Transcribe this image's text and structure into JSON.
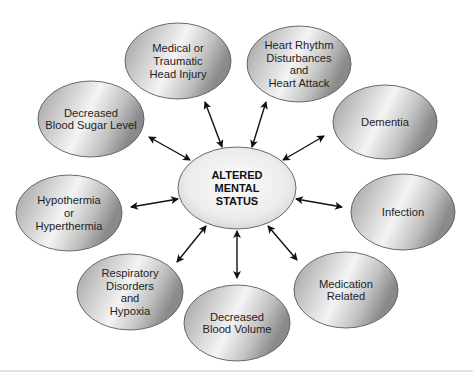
{
  "diagram": {
    "center": {
      "lines": [
        "ALTERED",
        "MENTAL",
        "STATUS"
      ],
      "cx": 237,
      "cy": 188,
      "rx": 59,
      "ry": 41
    },
    "nodes": [
      {
        "id": "medical-head-injury",
        "lines": [
          "Medical or",
          "Traumatic",
          "Head Injury"
        ],
        "cx": 178,
        "cy": 61,
        "rx": 53,
        "ry": 38,
        "arrow": [
          205,
          102,
          222,
          147
        ]
      },
      {
        "id": "heart-rhythm",
        "lines": [
          "Heart Rhythm",
          "Disturbances",
          "and",
          "Heart Attack"
        ],
        "cx": 299,
        "cy": 64,
        "rx": 52,
        "ry": 38,
        "arrow": [
          266,
          102,
          252,
          147
        ]
      },
      {
        "id": "dementia",
        "lines": [
          "Dementia"
        ],
        "cx": 385,
        "cy": 122,
        "rx": 52,
        "ry": 37,
        "arrow": [
          324,
          136,
          283,
          160
        ]
      },
      {
        "id": "infection",
        "lines": [
          "Infection"
        ],
        "cx": 403,
        "cy": 212,
        "rx": 52,
        "ry": 38,
        "arrow": [
          342,
          207,
          296,
          199
        ]
      },
      {
        "id": "medication-related",
        "lines": [
          "Medication",
          "Related"
        ],
        "cx": 346,
        "cy": 290,
        "rx": 52,
        "ry": 38,
        "arrow": [
          297,
          260,
          268,
          226
        ]
      },
      {
        "id": "decreased-blood-volume",
        "lines": [
          "Decreased",
          "Blood Volume"
        ],
        "cx": 237,
        "cy": 323,
        "rx": 53,
        "ry": 38,
        "arrow": [
          237,
          278,
          237,
          231
        ]
      },
      {
        "id": "respiratory-hypoxia",
        "lines": [
          "Respiratory",
          "Disorders",
          "and",
          "Hypoxia"
        ],
        "cx": 130,
        "cy": 292,
        "rx": 53,
        "ry": 38,
        "arrow": [
          177,
          262,
          206,
          226
        ]
      },
      {
        "id": "hypothermia-hyperthermia",
        "lines": [
          "Hypothermia",
          "or",
          "Hyperthermia"
        ],
        "cx": 69,
        "cy": 213,
        "rx": 53,
        "ry": 38,
        "arrow": [
          131,
          207,
          178,
          199
        ]
      },
      {
        "id": "decreased-blood-sugar",
        "lines": [
          "Decreased",
          "Blood Sugar Level"
        ],
        "cx": 91,
        "cy": 119,
        "rx": 53,
        "ry": 38,
        "arrow": [
          149,
          137,
          190,
          160
        ]
      }
    ],
    "colors": {
      "node_light": "#f2f2f2",
      "node_mid": "#c9c9c9",
      "node_dark": "#8e8e8e",
      "center_light": "#fafafa",
      "center_dark": "#d6d6d6",
      "stroke": "#5a5a5a",
      "arrow": "#111111",
      "rule": "#e2e2e2"
    }
  }
}
